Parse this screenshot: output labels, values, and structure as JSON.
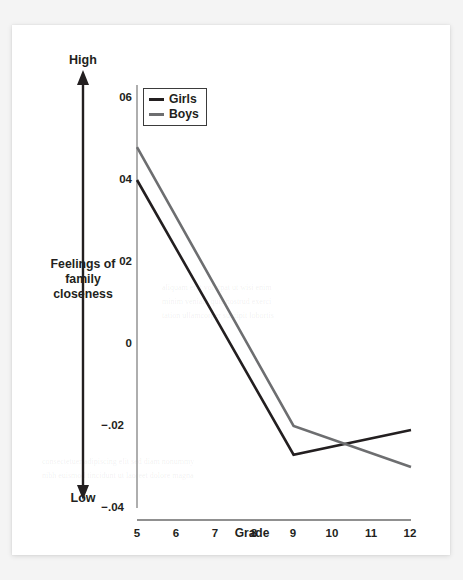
{
  "figure": {
    "background_color": "#ffffff",
    "page_color": "#f4f4f4",
    "ink_color": "#231f20"
  },
  "axis": {
    "y_top_label": "High",
    "y_bottom_label": "Low",
    "y_construct_line1": "Feelings of",
    "y_construct_line2": "family",
    "y_construct_line3": "closeness",
    "x_title": "Grade"
  },
  "legend": {
    "entries": [
      {
        "label": "Girls",
        "color": "#231f20"
      },
      {
        "label": "Boys",
        "color": "#6d6e70"
      }
    ]
  },
  "chart_data": {
    "type": "line",
    "title": "",
    "xlabel": "Grade",
    "ylabel": "Feelings of family closeness",
    "x": [
      5,
      6,
      7,
      8,
      9,
      10,
      11,
      12
    ],
    "xtick_labels": [
      "5",
      "6",
      "7",
      "8",
      "9",
      "10",
      "11",
      "12"
    ],
    "ytick_labels": [
      "06",
      "04",
      "02",
      "0",
      "−.02",
      "−.04"
    ],
    "ytick_values": [
      0.06,
      0.04,
      0.02,
      0.0,
      -0.02,
      -0.04
    ],
    "ylim": [
      -0.04,
      0.06
    ],
    "xlim": [
      5,
      12
    ],
    "grid": false,
    "legend_position": "top-left-inside",
    "annotations": [
      "High",
      "Low"
    ],
    "series": [
      {
        "name": "Girls",
        "color": "#231f20",
        "values": [
          0.04,
          null,
          null,
          null,
          -0.027,
          null,
          null,
          -0.021
        ],
        "defined_x": [
          5,
          9,
          12
        ],
        "defined_values": [
          0.04,
          -0.027,
          -0.021
        ]
      },
      {
        "name": "Boys",
        "color": "#6d6e70",
        "values": [
          0.048,
          null,
          null,
          null,
          -0.02,
          null,
          null,
          -0.03
        ],
        "defined_x": [
          5,
          9,
          12
        ],
        "defined_values": [
          0.048,
          -0.02,
          -0.03
        ]
      }
    ]
  }
}
